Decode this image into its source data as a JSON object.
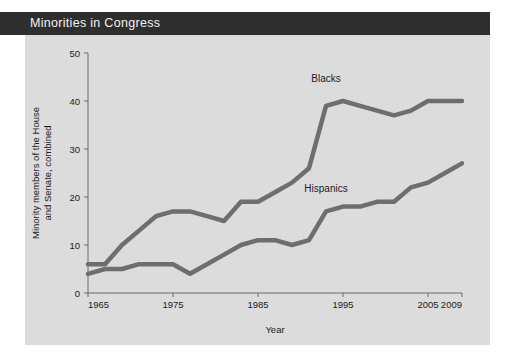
{
  "title": "Minorities in Congress",
  "chart_data": {
    "type": "line",
    "title": "Minorities in Congress",
    "xlabel": "Year",
    "ylabel": "Minority members of the House and Senate, combined",
    "xlim": [
      1965,
      2009
    ],
    "ylim": [
      0,
      50
    ],
    "grid": false,
    "legend_position": "inline-annotations",
    "xticks": [
      1965,
      1975,
      1985,
      1995,
      2005,
      2009
    ],
    "xtick_labels": [
      "1965",
      "1975",
      "1985",
      "1995",
      "2005",
      "2009"
    ],
    "yticks": [
      0,
      10,
      20,
      30,
      40,
      50
    ],
    "ytick_labels": [
      "0",
      "10",
      "20",
      "30",
      "40",
      "50"
    ],
    "x": [
      1965,
      1967,
      1969,
      1971,
      1973,
      1975,
      1977,
      1979,
      1981,
      1983,
      1985,
      1987,
      1989,
      1991,
      1993,
      1995,
      1997,
      1999,
      2001,
      2003,
      2005,
      2007,
      2009
    ],
    "series": [
      {
        "name": "Blacks",
        "color": "#6e6e6e",
        "label_x": 1993,
        "label_y": 44,
        "values": [
          6,
          6,
          10,
          13,
          16,
          17,
          17,
          16,
          15,
          19,
          19,
          21,
          23,
          26,
          39,
          40,
          39,
          38,
          37,
          38,
          40,
          40,
          40
        ]
      },
      {
        "name": "Hispanics",
        "color": "#6e6e6e",
        "label_x": 1993,
        "label_y": 21,
        "values": [
          4,
          5,
          5,
          6,
          6,
          6,
          4,
          6,
          8,
          10,
          11,
          11,
          10,
          11,
          17,
          18,
          18,
          19,
          19,
          22,
          23,
          25,
          27
        ]
      }
    ]
  },
  "colors": {
    "banner": "#2e2e2e",
    "banner_text": "#f2f2f2",
    "panel": "#dcdcdc",
    "line": "#6e6e6e",
    "axis": "#6b6b6b",
    "text": "#1b1b1b"
  }
}
